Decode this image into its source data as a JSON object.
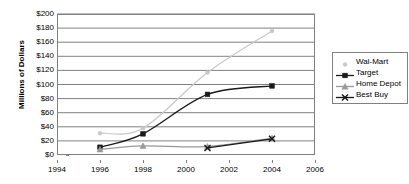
{
  "chart_data": {
    "type": "line",
    "title": "",
    "xlabel": "",
    "ylabel": "Millions of Dollars",
    "x": [
      1996,
      1998,
      2001,
      2004
    ],
    "xlim": [
      1994,
      2006
    ],
    "ylim": [
      0,
      200
    ],
    "grid": true,
    "legend_position": "right",
    "x_ticks": [
      "1994",
      "1996",
      "1998",
      "2000",
      "2002",
      "2004",
      "2006"
    ],
    "x_tick_values": [
      1994,
      1996,
      1998,
      2000,
      2002,
      2004,
      2006
    ],
    "y_ticks": [
      "$0",
      "$20",
      "$40",
      "$60",
      "$80",
      "$100",
      "$120",
      "$140",
      "$160",
      "$180",
      "$200"
    ],
    "y_tick_values": [
      0,
      20,
      40,
      60,
      80,
      100,
      120,
      140,
      160,
      180,
      200
    ],
    "series": [
      {
        "name": "Wal-Mart",
        "color": "#c8c8c8",
        "marker": "dot",
        "values": [
          31,
          38,
          117,
          176
        ]
      },
      {
        "name": "Target",
        "color": "#1a1a1a",
        "marker": "square",
        "values": [
          11,
          30,
          86,
          98
        ]
      },
      {
        "name": "Home Depot",
        "color": "#999999",
        "marker": "triangle",
        "values": [
          8,
          13,
          12,
          24
        ]
      },
      {
        "name": "Best Buy",
        "color": "#1a1a1a",
        "marker": "x",
        "values": [
          null,
          null,
          10,
          23
        ]
      }
    ]
  },
  "legend": {
    "items": [
      {
        "label": "Wal-Mart"
      },
      {
        "label": "Target"
      },
      {
        "label": "Home Depot"
      },
      {
        "label": "Best Buy"
      }
    ]
  },
  "colors": {
    "axis": "#808080",
    "gridline": "#808080",
    "plot_background": "#ffffff",
    "text": "#000000"
  }
}
